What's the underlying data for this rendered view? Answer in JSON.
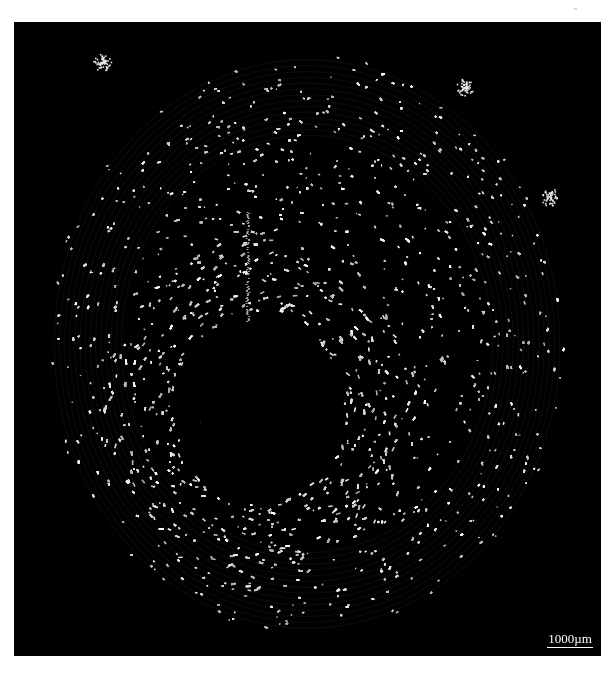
{
  "image": {
    "kind": "microscopy cross-section",
    "background_color": "#ffffff",
    "panel_color": "#000000",
    "speckle_color": "#e8e8e8"
  },
  "specimen": {
    "outer_disk": {
      "cx": 293,
      "cy": 322,
      "rx": 258,
      "ry": 290
    },
    "central_cavity": {
      "cx": 245,
      "cy": 387,
      "rx": 84,
      "ry": 96
    },
    "dense_ring_width": 70,
    "radial_fissure": {
      "x": 233,
      "y_top": 190,
      "y_bottom": 300
    },
    "edge_clusters": [
      {
        "x": 451,
        "y": 65
      },
      {
        "x": 536,
        "y": 175
      },
      {
        "x": 88,
        "y": 40
      }
    ]
  },
  "scale_bar": {
    "label": "1000µm"
  }
}
